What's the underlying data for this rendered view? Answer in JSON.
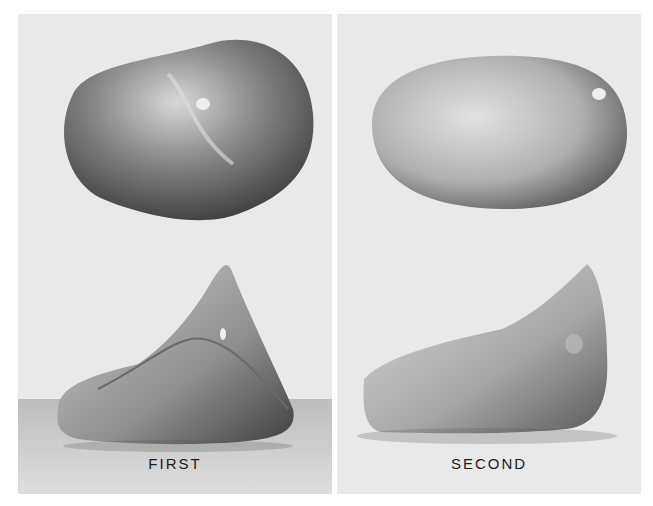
{
  "panels": [
    {
      "id": "first",
      "label": "FIRST",
      "views": [
        "top-view",
        "side-view"
      ]
    },
    {
      "id": "second",
      "label": "SECOND",
      "views": [
        "top-view",
        "side-view"
      ]
    }
  ],
  "colors": {
    "background": "#e9e9e9",
    "ground": "#cfcfcf",
    "text": "#1c1c1c"
  }
}
